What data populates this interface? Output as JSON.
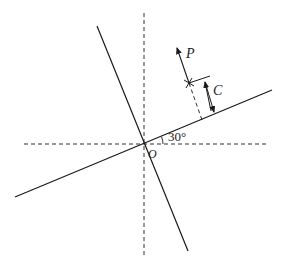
{
  "diagram": {
    "type": "geometry",
    "labels": {
      "force": "P",
      "distance": "C",
      "angle": "30°",
      "origin": "O"
    },
    "angle_deg": 30,
    "colors": {
      "stroke": "#1a1a1a",
      "background": "#ffffff"
    }
  }
}
